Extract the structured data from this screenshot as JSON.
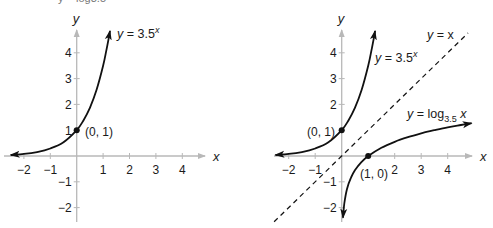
{
  "colors": {
    "axis": "#b8b8b8",
    "curve": "#111111",
    "point": "#111111",
    "text": "#1a1a1a"
  },
  "top_cut_text": "y = log3.5",
  "chart_data": [
    {
      "type": "line",
      "title": "",
      "xlabel": "x",
      "ylabel": "y",
      "xlim": [
        -2.5,
        5
      ],
      "ylim": [
        -2.5,
        5
      ],
      "x_ticks": [
        -2,
        -1,
        1,
        2,
        3,
        4
      ],
      "y_ticks": [
        -2,
        -1,
        1,
        2,
        3,
        4
      ],
      "grid": false,
      "series": [
        {
          "name": "y = 3.5^x",
          "label_main": "y  =  3.5",
          "label_sup": "x",
          "function": "3.5^x",
          "style": "solid",
          "x": [
            -2.5,
            -2,
            -1.5,
            -1,
            -0.5,
            0,
            0.25,
            0.5,
            0.75,
            1,
            1.1,
            1.2,
            1.26
          ],
          "y": [
            0.04,
            0.08,
            0.15,
            0.29,
            0.53,
            1,
            1.37,
            1.87,
            2.56,
            3.5,
            3.97,
            4.5,
            4.85
          ]
        }
      ],
      "points": [
        {
          "x": 0,
          "y": 1,
          "label": "(0, 1)"
        }
      ]
    },
    {
      "type": "line",
      "title": "",
      "xlabel": "x",
      "ylabel": "y",
      "xlim": [
        -2.5,
        5
      ],
      "ylim": [
        -2.5,
        5
      ],
      "x_ticks": [
        -2,
        -1,
        2,
        3,
        4
      ],
      "y_ticks": [
        -2,
        -1,
        1,
        2,
        3,
        4
      ],
      "grid": false,
      "series": [
        {
          "name": "y = 3.5^x",
          "label_main": "y  =  3.5",
          "label_sup": "x",
          "function": "3.5^x",
          "style": "solid",
          "x": [
            -2.5,
            -2,
            -1.5,
            -1,
            -0.5,
            0,
            0.25,
            0.5,
            0.75,
            1,
            1.1,
            1.2,
            1.26
          ],
          "y": [
            0.04,
            0.08,
            0.15,
            0.29,
            0.53,
            1,
            1.37,
            1.87,
            2.56,
            3.5,
            3.97,
            4.5,
            4.85
          ]
        },
        {
          "name": "y = x",
          "label_main": "y  =  x",
          "function": "x",
          "style": "dashed",
          "x": [
            -2.55,
            4.77
          ],
          "y": [
            -2.55,
            4.77
          ]
        },
        {
          "name": "y = log3.5 x",
          "label_main": "y  =  log",
          "label_sub": "3.5",
          "label_end": " x",
          "function": "log_3.5(x)",
          "style": "solid",
          "x": [
            0.05,
            0.1,
            0.2,
            0.35,
            0.5,
            0.75,
            1,
            1.5,
            2,
            2.5,
            3,
            3.5,
            4,
            4.5,
            4.9
          ],
          "y": [
            -2.39,
            -1.84,
            -1.28,
            -0.84,
            -0.55,
            -0.23,
            0,
            0.32,
            0.55,
            0.73,
            0.88,
            1,
            1.11,
            1.2,
            1.27
          ]
        }
      ],
      "points": [
        {
          "x": 0,
          "y": 1,
          "label": "(0, 1)"
        },
        {
          "x": 1,
          "y": 0,
          "label": "(1, 0)"
        }
      ]
    }
  ]
}
